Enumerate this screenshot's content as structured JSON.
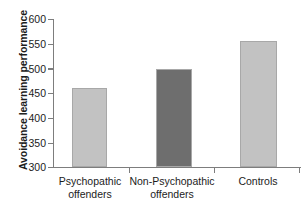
{
  "chart_data": {
    "type": "bar",
    "title": "",
    "subtitle": "",
    "xlabel": "",
    "ylabel": "Avoidance learning performance",
    "categories": [
      "Psychopathic offenders",
      "Non-Psychopathic offenders",
      "Controls"
    ],
    "category_lines": [
      [
        "Psychopathic",
        "offenders"
      ],
      [
        "Non-Psychopathic",
        "offenders"
      ],
      [
        "Controls"
      ]
    ],
    "values": [
      460,
      499,
      555
    ],
    "ylim": [
      300,
      600
    ],
    "yticks": [
      300,
      350,
      400,
      450,
      500,
      550,
      600
    ],
    "ytick_labels": [
      "300",
      "350",
      "400",
      "450",
      "500",
      "550",
      "600"
    ],
    "grid": false,
    "legend": false,
    "bar_colors": [
      "#c2c2c2",
      "#6e6e6e",
      "#c2c2c2"
    ],
    "bar_edge_color": "#a8a8a8",
    "axis_color": "#7d7d7d",
    "background_color": "#ffffff"
  },
  "axes": {
    "y_title": "Avoidance learning performance"
  }
}
